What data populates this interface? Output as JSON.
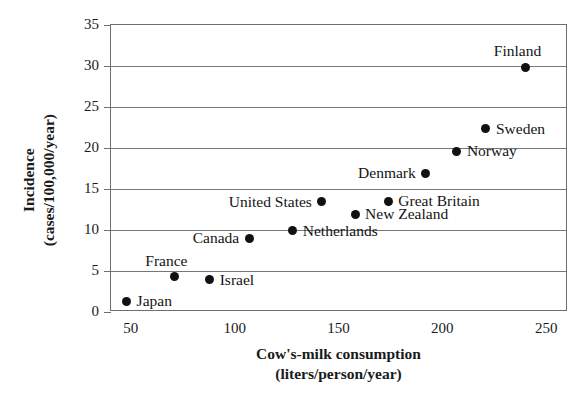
{
  "chart_data": {
    "type": "scatter",
    "title": "",
    "xlabel": "Cow's-milk consumption",
    "xlabel_units": "(liters/person/year)",
    "ylabel": "Incidence",
    "ylabel_units": "(cases/100,000/year)",
    "xlim": [
      40,
      260
    ],
    "ylim": [
      0,
      35
    ],
    "xticks": [
      50,
      100,
      150,
      200,
      250
    ],
    "yticks": [
      0,
      5,
      10,
      15,
      20,
      25,
      30,
      35
    ],
    "grid": "horizontal",
    "legend": "none",
    "point_color": "#111111",
    "frame_color": "#6e6e6e",
    "points": [
      {
        "label": "Japan",
        "x": 48,
        "y": 1.2,
        "label_pos": "right"
      },
      {
        "label": "France",
        "x": 71,
        "y": 4.2,
        "label_pos": "above-left"
      },
      {
        "label": "Israel",
        "x": 88,
        "y": 3.8,
        "label_pos": "right"
      },
      {
        "label": "Canada",
        "x": 107,
        "y": 8.9,
        "label_pos": "left"
      },
      {
        "label": "Netherlands",
        "x": 128,
        "y": 9.8,
        "label_pos": "right"
      },
      {
        "label": "United States",
        "x": 142,
        "y": 13.3,
        "label_pos": "left"
      },
      {
        "label": "New Zealand",
        "x": 158,
        "y": 11.8,
        "label_pos": "right"
      },
      {
        "label": "Great Britain",
        "x": 174,
        "y": 13.4,
        "label_pos": "right"
      },
      {
        "label": "Denmark",
        "x": 192,
        "y": 16.8,
        "label_pos": "left"
      },
      {
        "label": "Norway",
        "x": 207,
        "y": 19.5,
        "label_pos": "right"
      },
      {
        "label": "Sweden",
        "x": 221,
        "y": 22.2,
        "label_pos": "right"
      },
      {
        "label": "Finland",
        "x": 240,
        "y": 29.7,
        "label_pos": "above-left"
      }
    ]
  },
  "axis": {
    "y_tick_labels": [
      "35",
      "30",
      "25",
      "20",
      "15",
      "10",
      "5",
      "0"
    ],
    "x_tick_labels": [
      "50",
      "100",
      "150",
      "200",
      "250"
    ]
  }
}
